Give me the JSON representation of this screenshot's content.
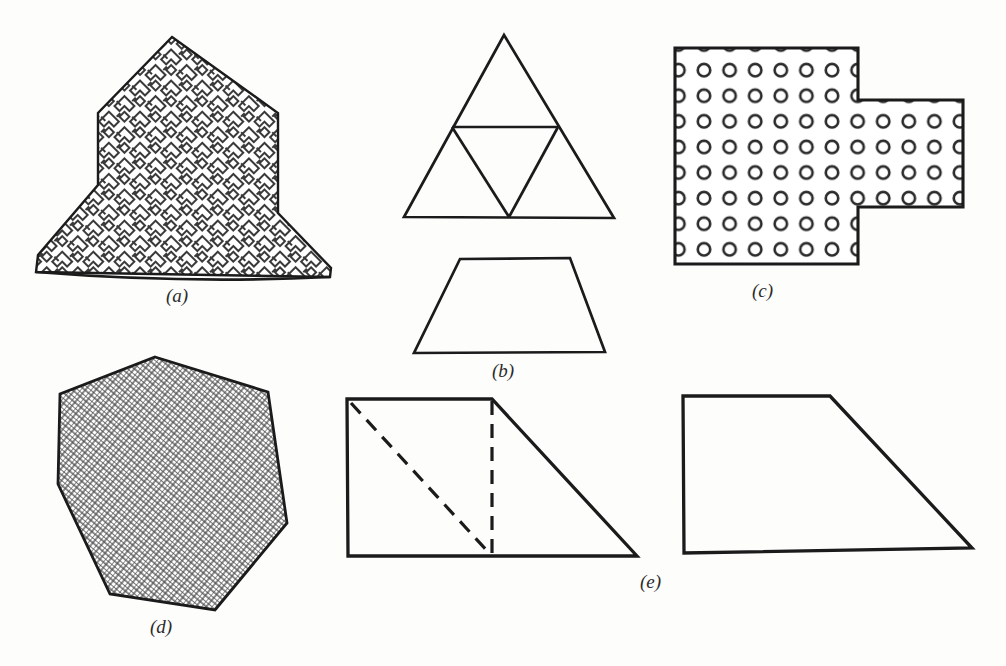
{
  "page": {
    "background": "#fdfdfc",
    "ink": "#1b1b1b",
    "top_caption_partial": "图1  每个图形都是一个",
    "width": 1006,
    "height": 666
  },
  "labels": [
    {
      "id": "a",
      "text": "(a)",
      "x": 166,
      "y": 285
    },
    {
      "id": "b",
      "text": "(b)",
      "x": 492,
      "y": 360
    },
    {
      "id": "c",
      "text": "(c)",
      "x": 752,
      "y": 280
    },
    {
      "id": "d",
      "text": "(d)",
      "x": 150,
      "y": 616
    },
    {
      "id": "e",
      "text": "(e)",
      "x": 640,
      "y": 571
    }
  ],
  "figures": [
    {
      "id": "a",
      "name": "arrow-polygon-fret-hatched",
      "fill": "key-fret-maze-pattern",
      "stroke": "#1b1b1b",
      "stroke_width": 2.4,
      "points": "172,37 98,113 98,185 38,255 36,272 330,277 331,268 278,213 278,113"
    },
    {
      "id": "b-triangle",
      "name": "equilateral-triangle-subdivided",
      "fill": "none",
      "stroke": "#1b1b1b",
      "stroke_width": 2.6,
      "points": "504,35 614,218 404,217",
      "internal_lines": [
        {
          "x1": 452,
          "y1": 127,
          "x2": 558,
          "y2": 127
        },
        {
          "x1": 452,
          "y1": 127,
          "x2": 509,
          "y2": 217
        },
        {
          "x1": 558,
          "y1": 127,
          "x2": 509,
          "y2": 217
        }
      ]
    },
    {
      "id": "b-trapezoid",
      "name": "isosceles-trapezoid",
      "fill": "none",
      "stroke": "#1b1b1b",
      "stroke_width": 2.6,
      "points": "460,259 570,258 605,352 414,353"
    },
    {
      "id": "c",
      "name": "cross-step-polygon-circle-dotted",
      "fill": "circle-grid-pattern",
      "stroke": "#1b1b1b",
      "stroke_width": 3.0,
      "points": "675,48 858,48 858,100 963,100 963,207 858,207 858,264 675,264",
      "circle_grid": {
        "spacing": 25.6,
        "radius": 6.2,
        "origin_x": 688,
        "origin_y": 67,
        "rows": 8,
        "cols_main": 7,
        "cols_tab": 4,
        "tab_rows": [
          2,
          3,
          4,
          5
        ]
      }
    },
    {
      "id": "d",
      "name": "hexagon-crosshatched",
      "fill": "fine-crosshatch-pattern",
      "stroke": "#1b1b1b",
      "stroke_width": 2.8,
      "points": "155,357 268,392 287,523 215,610 110,594 58,484 60,394"
    },
    {
      "id": "e-left",
      "name": "right-trapezoid-with-dashed-decomposition",
      "fill": "none",
      "stroke": "#1b1b1b",
      "stroke_width": 3.2,
      "points": "347,399 492,399 637,556 348,556",
      "dashed_lines": [
        {
          "name": "dashed-vertical",
          "x1": 492,
          "y1": 399,
          "x2": 492,
          "y2": 556
        },
        {
          "name": "dashed-diagonal",
          "x1": 350,
          "y1": 402,
          "x2": 490,
          "y2": 554
        }
      ],
      "dash_pattern": "14 9"
    },
    {
      "id": "e-right",
      "name": "right-trapezoid-plain",
      "fill": "none",
      "stroke": "#1b1b1b",
      "stroke_width": 3.2,
      "points": "683,396 830,396 972,548 684,553"
    }
  ]
}
